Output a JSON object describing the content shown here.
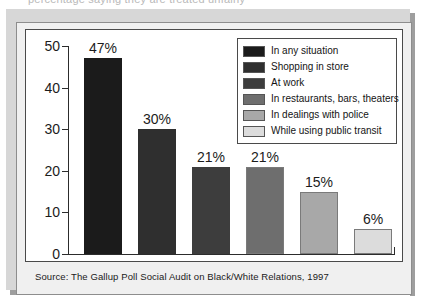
{
  "figure": {
    "clipped_headline": "percentage saying they are treated unfairly",
    "caption": "Source: The Gallup Poll Social Audit on Black/White Relations, 1997"
  },
  "chart_data": {
    "type": "bar",
    "title": "",
    "xlabel": "",
    "ylabel": "",
    "ylim": [
      0,
      50
    ],
    "yticks": [
      0,
      10,
      20,
      30,
      40,
      50
    ],
    "ytick_labels": [
      "0",
      "10",
      "20",
      "30",
      "40",
      "50"
    ],
    "grid": false,
    "legend_position": "top-right",
    "categories": [
      "In any situation",
      "Shopping in store",
      "At work",
      "In restaurants, bars, theaters",
      "In dealings with police",
      "While using public transit"
    ],
    "values": [
      47,
      30,
      21,
      21,
      15,
      6
    ],
    "data_labels": [
      "47%",
      "30%",
      "21%",
      "21%",
      "15%",
      "6%"
    ],
    "colors": [
      "#1b1b1b",
      "#2f2f2f",
      "#3d3d3d",
      "#6e6e6e",
      "#a8a8a8",
      "#dcdcdc"
    ]
  },
  "legend": {
    "items": [
      {
        "label": "In any situation",
        "color": "#1b1b1b"
      },
      {
        "label": "Shopping in store",
        "color": "#2f2f2f"
      },
      {
        "label": "At work",
        "color": "#3d3d3d"
      },
      {
        "label": "In restaurants, bars, theaters",
        "color": "#6e6e6e"
      },
      {
        "label": "In dealings with police",
        "color": "#a8a8a8"
      },
      {
        "label": "While using public transit",
        "color": "#dcdcdc"
      }
    ]
  }
}
